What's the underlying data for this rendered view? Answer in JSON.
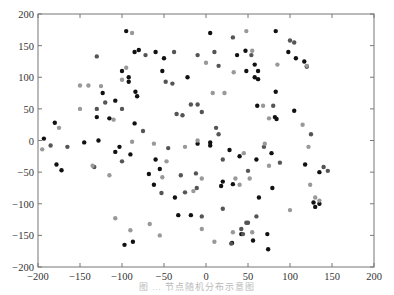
{
  "chart_data": {
    "type": "scatter",
    "title": "",
    "xlabel": "",
    "ylabel": "",
    "xlim": [
      -200,
      200
    ],
    "ylim": [
      -200,
      200
    ],
    "xticks": [
      -200,
      -150,
      -100,
      -50,
      0,
      50,
      100,
      150,
      200
    ],
    "yticks": [
      -200,
      -150,
      -100,
      -50,
      0,
      50,
      100,
      150,
      200
    ],
    "grid": false,
    "legend": null,
    "caption": "图 … 节点随机分布示意图",
    "series": [
      {
        "name": "black",
        "color": "#111111",
        "points": [
          [
            -95,
            173
          ],
          [
            -80,
            143
          ],
          [
            -60,
            140
          ],
          [
            -85,
            140
          ],
          [
            -50,
            130
          ],
          [
            -100,
            110
          ],
          [
            -52,
            110
          ],
          [
            -92,
            100
          ],
          [
            -92,
            93
          ],
          [
            -84,
            77
          ],
          [
            -123,
            75
          ],
          [
            -108,
            63
          ],
          [
            -82,
            70
          ],
          [
            -130,
            37
          ],
          [
            -115,
            35
          ],
          [
            -85,
            27
          ],
          [
            -180,
            28
          ],
          [
            -193,
            3
          ],
          [
            -145,
            -3
          ],
          [
            -128,
            0
          ],
          [
            -103,
            -10
          ],
          [
            -108,
            -18
          ],
          [
            -90,
            -22
          ],
          [
            -178,
            -38
          ],
          [
            -172,
            -47
          ],
          [
            -55,
            -45
          ],
          [
            -68,
            -53
          ],
          [
            -62,
            -70
          ],
          [
            -37,
            -90
          ],
          [
            -33,
            -118
          ],
          [
            -18,
            -118
          ],
          [
            -97,
            -165
          ],
          [
            -87,
            -160
          ],
          [
            -10,
            -5
          ],
          [
            5,
            -3
          ],
          [
            5,
            170
          ],
          [
            -22,
            100
          ],
          [
            37,
            135
          ],
          [
            47,
            142
          ],
          [
            58,
            120
          ],
          [
            62,
            110
          ],
          [
            58,
            100
          ],
          [
            62,
            97
          ],
          [
            83,
            77
          ],
          [
            61,
            55
          ],
          [
            83,
            173
          ],
          [
            98,
            140
          ],
          [
            117,
            125
          ],
          [
            107,
            130
          ],
          [
            120,
            117
          ],
          [
            105,
            47
          ],
          [
            82,
            37
          ],
          [
            84,
            34
          ],
          [
            48,
            110
          ],
          [
            5,
            -8
          ],
          [
            20,
            -65
          ],
          [
            32,
            -69
          ],
          [
            63,
            -90
          ],
          [
            79,
            -75
          ],
          [
            28,
            -15
          ],
          [
            40,
            -25
          ],
          [
            78,
            -20
          ],
          [
            135,
            -50
          ],
          [
            130,
            -105
          ],
          [
            135,
            -100
          ],
          [
            128,
            -98
          ],
          [
            42,
            -148
          ],
          [
            56,
            -158
          ],
          [
            74,
            -172
          ],
          [
            31,
            -162
          ],
          [
            73,
            -148
          ],
          [
            60,
            -30
          ],
          [
            18,
            -72
          ],
          [
            118,
            -38
          ],
          [
            -60,
            -30
          ]
        ]
      },
      {
        "name": "dark-gray",
        "color": "#555555",
        "points": [
          [
            -130,
            133
          ],
          [
            -72,
            135
          ],
          [
            -38,
            140
          ],
          [
            -10,
            135
          ],
          [
            32,
            163
          ],
          [
            10,
            140
          ],
          [
            15,
            118
          ],
          [
            54,
            135
          ],
          [
            -120,
            60
          ],
          [
            -40,
            90
          ],
          [
            -48,
            93
          ],
          [
            -100,
            50
          ],
          [
            -130,
            50
          ],
          [
            -28,
            40
          ],
          [
            -35,
            42
          ],
          [
            -5,
            45
          ],
          [
            -10,
            57
          ],
          [
            -18,
            57
          ],
          [
            -75,
            15
          ],
          [
            -185,
            -8
          ],
          [
            -165,
            -10
          ],
          [
            -133,
            -42
          ],
          [
            -100,
            -33
          ],
          [
            -53,
            -83
          ],
          [
            -45,
            -12
          ],
          [
            -30,
            -55
          ],
          [
            -25,
            -82
          ],
          [
            100,
            158
          ],
          [
            105,
            155
          ],
          [
            42,
            -140
          ],
          [
            30,
            -163
          ],
          [
            50,
            -48
          ],
          [
            50,
            -130
          ],
          [
            69,
            -10
          ],
          [
            -12,
            -52
          ],
          [
            -11,
            -75
          ],
          [
            15,
            10
          ],
          [
            12,
            20
          ],
          [
            20,
            -30
          ],
          [
            125,
            10
          ],
          [
            140,
            -42
          ],
          [
            80,
            55
          ],
          [
            145,
            -48
          ],
          [
            88,
            -35
          ],
          [
            -5,
            -120
          ],
          [
            20,
            -108
          ],
          [
            44,
            -148
          ],
          [
            48,
            -130
          ],
          [
            60,
            -120
          ]
        ]
      },
      {
        "name": "light-gray",
        "color": "#999999",
        "points": [
          [
            -88,
            170
          ],
          [
            -150,
            87
          ],
          [
            -140,
            87
          ],
          [
            -125,
            86
          ],
          [
            -150,
            50
          ],
          [
            -100,
            96
          ],
          [
            -95,
            115
          ],
          [
            -110,
            33
          ],
          [
            -175,
            20
          ],
          [
            -88,
            -2
          ],
          [
            -10,
            0
          ],
          [
            -62,
            -5
          ],
          [
            -135,
            -40
          ],
          [
            -115,
            -55
          ],
          [
            -52,
            -58
          ],
          [
            -47,
            -33
          ],
          [
            -108,
            -123
          ],
          [
            -90,
            -142
          ],
          [
            -67,
            -132
          ],
          [
            -55,
            -150
          ],
          [
            -15,
            -80
          ],
          [
            -5,
            -140
          ],
          [
            10,
            -160
          ],
          [
            0,
            123
          ],
          [
            -5,
            -60
          ],
          [
            55,
            142
          ],
          [
            48,
            173
          ],
          [
            85,
            120
          ],
          [
            120,
            118
          ],
          [
            33,
            108
          ],
          [
            68,
            55
          ],
          [
            75,
            35
          ],
          [
            8,
            75
          ],
          [
            22,
            75
          ],
          [
            115,
            25
          ],
          [
            130,
            -90
          ],
          [
            135,
            -95
          ],
          [
            -25,
            -10
          ],
          [
            32,
            -145
          ],
          [
            55,
            -145
          ],
          [
            40,
            -70
          ],
          [
            52,
            -60
          ],
          [
            100,
            -110
          ],
          [
            124,
            -70
          ],
          [
            70,
            -5
          ],
          [
            75,
            -40
          ],
          [
            35,
            -60
          ],
          [
            45,
            -20
          ],
          [
            122,
            -10
          ],
          [
            -195,
            -14
          ]
        ]
      }
    ]
  }
}
